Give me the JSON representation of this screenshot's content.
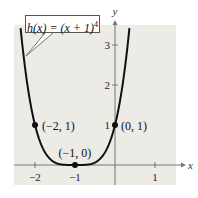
{
  "chart_data": {
    "type": "line",
    "title": "",
    "function_label": "h(x) = (x + 1)^4",
    "function_label_parts": {
      "lhs": "h(x) = (x + 1)",
      "exponent": "4"
    },
    "xlabel": "x",
    "ylabel": "y",
    "xlim": [
      -2.5,
      1.5
    ],
    "ylim": [
      -0.5,
      3.5
    ],
    "x_ticks": [
      -2,
      -1,
      1
    ],
    "x_tick_labels": [
      "−2",
      "−1",
      "1"
    ],
    "y_ticks": [
      1,
      2,
      3
    ],
    "y_tick_labels": [
      "1",
      "2",
      "3"
    ],
    "grid": false,
    "series": [
      {
        "name": "h(x) = (x + 1)^4",
        "x": [
          -2.36,
          -2.2,
          -2.0,
          -1.8,
          -1.6,
          -1.4,
          -1.2,
          -1.0,
          -0.8,
          -0.6,
          -0.4,
          -0.2,
          0.0,
          0.2,
          0.36
        ],
        "y": [
          3.42,
          2.07,
          1.0,
          0.41,
          0.13,
          0.03,
          0.0016,
          0.0,
          0.0016,
          0.03,
          0.13,
          0.41,
          1.0,
          2.07,
          3.42
        ]
      }
    ],
    "points": [
      {
        "x": -2,
        "y": 1,
        "label": "(−2, 1)"
      },
      {
        "x": -1,
        "y": 0,
        "label": "(−1, 0)"
      },
      {
        "x": 0,
        "y": 1,
        "label": "(0, 1)"
      }
    ],
    "colors": {
      "background": "#ecebe5",
      "curve": "#111111",
      "axis": "#777777"
    }
  }
}
